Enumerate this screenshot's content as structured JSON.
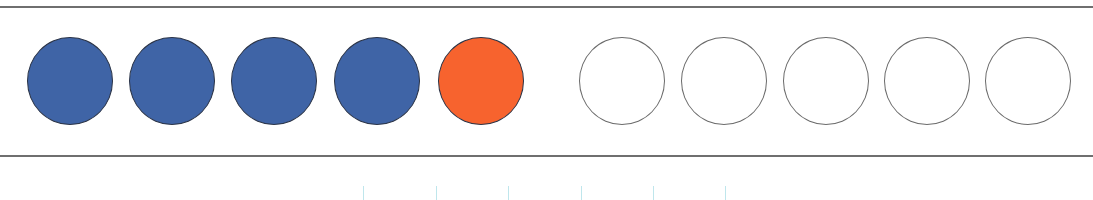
{
  "diagram": {
    "type": "ten-frame-counters",
    "total_slots": 10,
    "filled_count": 5,
    "empty_count": 5,
    "colors": {
      "blue": "#3f64a6",
      "orange": "#f7632e",
      "empty": "#ffffff",
      "frame_line": "#6f6f6f",
      "tick": "#bfe6ec"
    },
    "counters": [
      {
        "index": 1,
        "state": "filled",
        "color": "#3f64a6",
        "cx": 70
      },
      {
        "index": 2,
        "state": "filled",
        "color": "#3f64a6",
        "cx": 172
      },
      {
        "index": 3,
        "state": "filled",
        "color": "#3f64a6",
        "cx": 274
      },
      {
        "index": 4,
        "state": "filled",
        "color": "#3f64a6",
        "cx": 377
      },
      {
        "index": 5,
        "state": "filled",
        "color": "#f7632e",
        "cx": 481
      },
      {
        "index": 6,
        "state": "empty",
        "color": "#ffffff",
        "cx": 622
      },
      {
        "index": 7,
        "state": "empty",
        "color": "#ffffff",
        "cx": 724
      },
      {
        "index": 8,
        "state": "empty",
        "color": "#ffffff",
        "cx": 826
      },
      {
        "index": 9,
        "state": "empty",
        "color": "#ffffff",
        "cx": 927
      },
      {
        "index": 10,
        "state": "empty",
        "color": "#ffffff",
        "cx": 1028
      }
    ],
    "ticks_x": [
      363,
      436,
      508,
      581,
      653,
      725
    ]
  }
}
